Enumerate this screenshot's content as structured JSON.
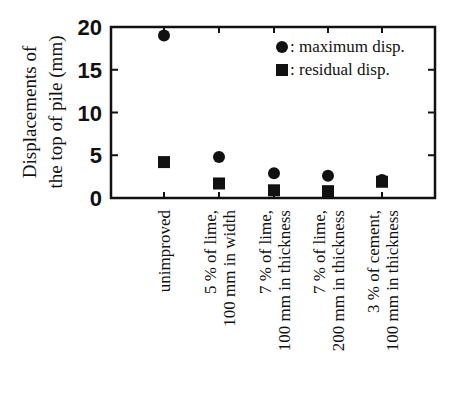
{
  "chart_data": {
    "type": "scatter",
    "title": "",
    "xlabel": "",
    "ylabel": "Displacements of the top of pile (mm)",
    "ylabel_lines": [
      "Displacements of",
      "the top of pile (mm)"
    ],
    "ylim": [
      0,
      20
    ],
    "yticks": [
      "0",
      "5",
      "10",
      "15",
      "20"
    ],
    "grid": false,
    "legend_position": "upper right",
    "categories": [
      "unimproved",
      "5 % of lime, 100 mm in width",
      "7 % of lime, 100 mm in thickness",
      "7 % of lime, 200 mm in thickness",
      "3 % of cement, 100 mm in thickness"
    ],
    "category_lines": [
      [
        "unimproved"
      ],
      [
        "5 % of lime,",
        "100 mm in width"
      ],
      [
        "7 % of lime,",
        "100 mm in thickness"
      ],
      [
        "7 % of lime,",
        "200 mm in thickness"
      ],
      [
        "3 % of cement,",
        "100 mm in thickness"
      ]
    ],
    "series": [
      {
        "name": "maximum disp.",
        "marker": "circle",
        "values": [
          19.0,
          4.8,
          2.9,
          2.6,
          2.1
        ]
      },
      {
        "name": "residual disp.",
        "marker": "square",
        "values": [
          4.2,
          1.7,
          0.9,
          0.8,
          1.9
        ]
      }
    ]
  },
  "legend": {
    "items": [
      {
        "label": ": maximum disp.",
        "marker": "circle"
      },
      {
        "label": ": residual disp.",
        "marker": "square"
      }
    ]
  },
  "colors": {
    "ink": "#111111",
    "background": "#ffffff"
  }
}
